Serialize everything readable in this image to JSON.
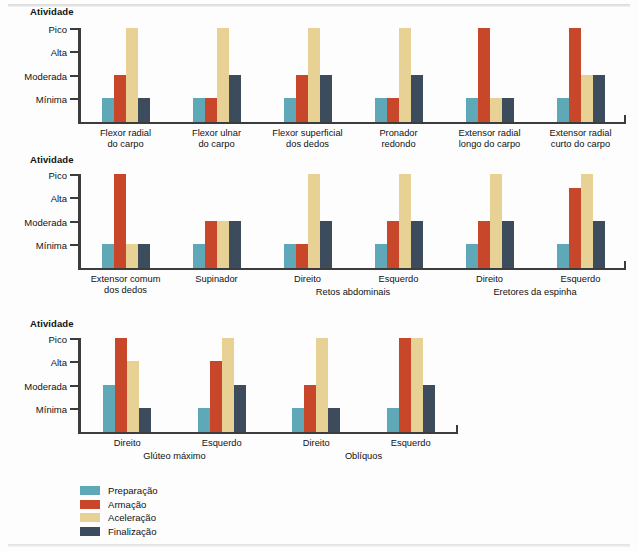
{
  "chart_data": [
    {
      "type": "bar",
      "title": "Atividade",
      "ylabel": "Atividade",
      "xlabel": "",
      "grid": false,
      "legend_position": "bottom-left",
      "ytick_labels": [
        "Mínima",
        "Moderada",
        "Alta",
        "Pico"
      ],
      "ylim": [
        0,
        4
      ],
      "categories": [
        "Flexor radial\ndo carpo",
        "Flexor ulnar\ndo carpo",
        "Flexor superficial\ndos dedos",
        "Pronador\nredondo",
        "Extensor radial\nlongo do carpo",
        "Extensor radial\ncurto do carpo"
      ],
      "series": [
        {
          "name": "Preparação",
          "values": [
            1,
            1,
            1,
            1,
            1,
            1
          ]
        },
        {
          "name": "Armação",
          "values": [
            2,
            1,
            2,
            1,
            4,
            4
          ]
        },
        {
          "name": "Aceleração",
          "values": [
            4,
            4,
            4,
            4,
            1,
            2
          ]
        },
        {
          "name": "Finalização",
          "values": [
            1,
            2,
            2,
            2,
            1,
            2
          ]
        }
      ]
    },
    {
      "type": "bar",
      "title": "Atividade",
      "ylabel": "Atividade",
      "xlabel": "",
      "grid": false,
      "legend_position": "bottom-left",
      "ytick_labels": [
        "Mínima",
        "Moderada",
        "Alta",
        "Pico"
      ],
      "ylim": [
        0,
        4
      ],
      "categories": [
        "Extensor comum\ndos dedos",
        "Supinador",
        "Direito",
        "Esquerdo",
        "Direito",
        "Esquerdo"
      ],
      "group_headers": [
        {
          "label": "Retos abdominais",
          "spans": [
            2,
            3
          ]
        },
        {
          "label": "Eretores da espinha",
          "spans": [
            4,
            5
          ]
        }
      ],
      "series": [
        {
          "name": "Preparação",
          "values": [
            1,
            1,
            1,
            1,
            1,
            1
          ]
        },
        {
          "name": "Armação",
          "values": [
            4,
            2,
            1,
            2,
            2,
            3.4
          ]
        },
        {
          "name": "Aceleração",
          "values": [
            1,
            2,
            4,
            4,
            4,
            4
          ]
        },
        {
          "name": "Finalização",
          "values": [
            1,
            2,
            2,
            2,
            2,
            2
          ]
        }
      ]
    },
    {
      "type": "bar",
      "title": "Atividade",
      "ylabel": "Atividade",
      "xlabel": "",
      "grid": false,
      "legend_position": "bottom-left",
      "ytick_labels": [
        "Mínima",
        "Moderada",
        "Alta",
        "Pico"
      ],
      "ylim": [
        0,
        4
      ],
      "categories": [
        "Direito",
        "Esquerdo",
        "Direito",
        "Esquerdo"
      ],
      "group_headers": [
        {
          "label": "Glúteo máximo",
          "spans": [
            0,
            1
          ]
        },
        {
          "label": "Oblíquos",
          "spans": [
            2,
            3
          ]
        }
      ],
      "series": [
        {
          "name": "Preparação",
          "values": [
            2,
            1,
            1,
            1
          ]
        },
        {
          "name": "Armação",
          "values": [
            4,
            3,
            2,
            4
          ]
        },
        {
          "name": "Aceleração",
          "values": [
            3,
            4,
            4,
            4
          ]
        },
        {
          "name": "Finalização",
          "values": [
            1,
            2,
            1,
            2
          ]
        }
      ]
    }
  ],
  "colors": {
    "preparacao": "#5FA8B8",
    "armacao": "#C8462A",
    "aceleracao": "#E7D194",
    "finalizacao": "#3D4C5C",
    "axis": "#3c3c3c",
    "text": "#111111",
    "background": "#fdfdfd"
  },
  "panels": [
    {
      "axis_title": "Atividade"
    },
    {
      "axis_title": "Atividade"
    },
    {
      "axis_title": "Atividade"
    }
  ],
  "legend": {
    "items": [
      {
        "label": "Preparação",
        "color": "#5FA8B8"
      },
      {
        "label": "Armação",
        "color": "#C8462A"
      },
      {
        "label": "Aceleração",
        "color": "#E7D194"
      },
      {
        "label": "Finalização",
        "color": "#3D4C5C"
      }
    ]
  }
}
